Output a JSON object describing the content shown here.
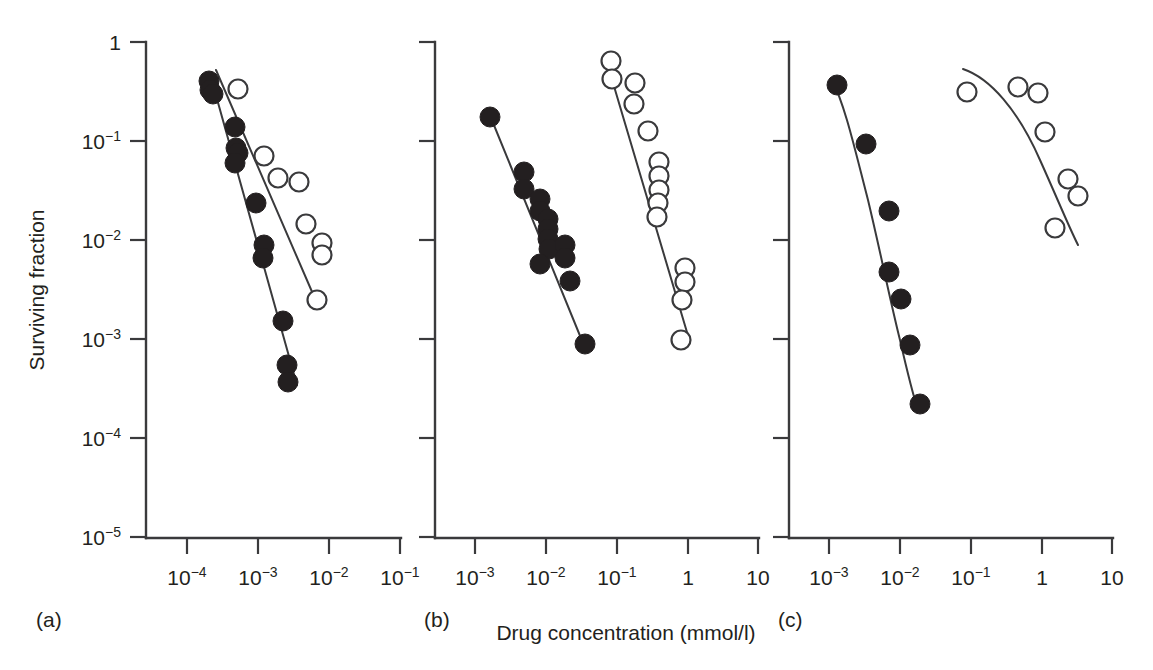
{
  "figure": {
    "xlabel": "Drug concentration (mmol/l)",
    "ylabel": "Surviving fraction",
    "panel_labels": [
      "(a)",
      "(b)",
      "(c)"
    ],
    "colors": {
      "ink": "#231f20",
      "axis": "#3a3a3c",
      "background": "#ffffff"
    }
  },
  "chart_data": [
    {
      "type": "scatter",
      "panel": "(a)",
      "title": "",
      "xlabel": "Drug concentration (mmol/l)",
      "ylabel": "Surviving fraction",
      "xscale": "log",
      "yscale": "log",
      "xlim": [
        3.1623e-05,
        0.31623
      ],
      "ylim": [
        1e-05,
        1
      ],
      "xticks": [
        0.0001,
        0.001,
        0.01,
        0.1
      ],
      "xticklabels": [
        "10^-4",
        "10^-3",
        "10^-2",
        "10^-1"
      ],
      "yticks": [
        1,
        0.1,
        0.01,
        0.001,
        0.0001,
        1e-05
      ],
      "yticklabels": [
        "1",
        "10^-1",
        "10^-2",
        "10^-3",
        "10^-4",
        "10^-5"
      ],
      "grid": false,
      "legend": null,
      "series": [
        {
          "name": "closed-circles",
          "marker": "filled-circle",
          "x": [
            0.00023,
            0.00024,
            0.00026,
            0.00046,
            0.00049,
            0.00052,
            0.00054,
            0.00095,
            0.00125,
            0.0013,
            0.0024,
            0.0025,
            0.0026
          ],
          "y": [
            0.4,
            0.33,
            0.3,
            0.115,
            0.072,
            0.062,
            0.047,
            0.022,
            0.0065,
            0.0048,
            0.0014,
            0.00026,
            0.00017
          ]
        },
        {
          "name": "open-circles",
          "marker": "open-circle",
          "x": [
            0.00037,
            0.00093,
            0.0013,
            0.002,
            0.0028,
            0.004,
            0.0044,
            0.0048
          ],
          "y": [
            0.33,
            0.093,
            0.047,
            0.043,
            0.0155,
            0.0105,
            0.0082,
            0.0025
          ]
        }
      ],
      "fit_lines": [
        {
          "name": "closed-fit",
          "x": [
            0.00024,
            0.003
          ],
          "y": [
            0.37,
            0.00012
          ]
        },
        {
          "name": "open-fit",
          "x": [
            0.00028,
            0.005
          ],
          "y": [
            0.4,
            0.0022
          ]
        }
      ]
    },
    {
      "type": "scatter",
      "panel": "(b)",
      "title": "",
      "xlabel": "Drug concentration (mmol/l)",
      "ylabel": "Surviving fraction",
      "xscale": "log",
      "yscale": "log",
      "xlim": [
        0.00031623,
        31.623
      ],
      "ylim": [
        1e-05,
        1
      ],
      "xticks": [
        0.001,
        0.01,
        0.1,
        1,
        10
      ],
      "xticklabels": [
        "10^-3",
        "10^-2",
        "10^-1",
        "1",
        "10"
      ],
      "yticks": [
        1,
        0.1,
        0.01,
        0.001,
        0.0001,
        1e-05
      ],
      "yticklabels": [
        "1",
        "10^-1",
        "10^-2",
        "10^-3",
        "10^-4",
        "10^-5"
      ],
      "grid": false,
      "legend": null,
      "series": [
        {
          "name": "closed-circles",
          "marker": "filled-circle",
          "x": [
            0.0015,
            0.0046,
            0.0048,
            0.0066,
            0.0069,
            0.0086,
            0.0088,
            0.0091,
            0.0093,
            0.0095,
            0.0135,
            0.014,
            0.0205
          ],
          "y": [
            0.175,
            0.048,
            0.037,
            0.027,
            0.022,
            0.0175,
            0.016,
            0.015,
            0.014,
            0.0038,
            0.006,
            0.0053,
            0.00046
          ]
        },
        {
          "name": "open-circles",
          "marker": "open-circle",
          "x": [
            0.09,
            0.095,
            0.16,
            0.17,
            0.26,
            0.34,
            0.35,
            0.36,
            0.38,
            0.4,
            0.9,
            0.93,
            0.96,
            1.05
          ],
          "y": [
            0.52,
            0.37,
            0.37,
            0.28,
            0.175,
            0.07,
            0.06,
            0.052,
            0.044,
            0.037,
            0.005,
            0.0042,
            0.003,
            0.00075
          ]
        }
      ],
      "fit_lines": [
        {
          "name": "closed-fit",
          "x": [
            0.0015,
            0.021
          ],
          "y": [
            0.175,
            0.00046
          ]
        },
        {
          "name": "open-fit",
          "x": [
            0.09,
            1.25
          ],
          "y": [
            0.46,
            0.0009
          ]
        }
      ]
    },
    {
      "type": "scatter",
      "panel": "(c)",
      "title": "",
      "xlabel": "Drug concentration (mmol/l)",
      "ylabel": "Surviving fraction",
      "xscale": "log",
      "yscale": "log",
      "xlim": [
        0.00031623,
        31.623
      ],
      "ylim": [
        1e-05,
        1
      ],
      "xticks": [
        0.001,
        0.01,
        0.1,
        1,
        10
      ],
      "xticklabels": [
        "10^-3",
        "10^-2",
        "10^-1",
        "1",
        "10"
      ],
      "yticks": [
        1,
        0.1,
        0.01,
        0.001,
        0.0001,
        1e-05
      ],
      "yticklabels": [
        "1",
        "10^-1",
        "10^-2",
        "10^-3",
        "10^-4",
        "10^-5"
      ],
      "grid": false,
      "legend": null,
      "series": [
        {
          "name": "closed-circles",
          "marker": "filled-circle",
          "x": [
            0.00145,
            0.0031,
            0.0054,
            0.0076,
            0.0094,
            0.0125,
            0.0185
          ],
          "y": [
            0.37,
            0.08,
            0.0135,
            0.0032,
            0.00145,
            0.0005,
            0.0001
          ]
        },
        {
          "name": "open-circles",
          "marker": "open-circle",
          "x": [
            0.085,
            0.5,
            0.82,
            0.95,
            1.9,
            2.3,
            2.9
          ],
          "y": [
            0.26,
            0.29,
            0.27,
            0.125,
            0.037,
            0.03,
            0.019
          ]
        }
      ],
      "fit_lines": [
        {
          "name": "closed-fit",
          "x": [
            0.00145,
            0.019
          ],
          "y": [
            0.4,
            9e-05
          ]
        },
        {
          "name": "open-fit",
          "x": [
            0.1,
            3.0
          ],
          "y": [
            0.52,
            0.0095
          ]
        }
      ]
    }
  ]
}
